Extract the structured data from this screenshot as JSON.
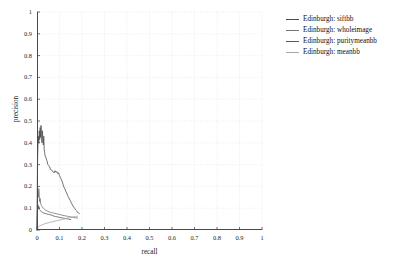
{
  "chart_data": {
    "type": "line",
    "title": "",
    "xlabel": "recall",
    "ylabel": "precision",
    "xlim": [
      0,
      1
    ],
    "ylim": [
      0,
      1
    ],
    "grid": true,
    "grid_style": "dotted",
    "legend_position": "right",
    "xticks": [
      "0",
      "0.1",
      "0.2",
      "0.3",
      "0.4",
      "0.5",
      "0.6",
      "0.7",
      "0.8",
      "0.9",
      "1"
    ],
    "xtick_values": [
      0,
      0.1,
      0.2,
      0.3,
      0.4,
      0.5,
      0.6,
      0.7,
      0.8,
      0.9,
      1
    ],
    "yticks": [
      "0",
      "0.1",
      "0.2",
      "0.3",
      "0.4",
      "0.5",
      "0.6",
      "0.7",
      "0.8",
      "0.9",
      "1"
    ],
    "ytick_values": [
      0,
      0.1,
      0.2,
      0.3,
      0.4,
      0.5,
      0.6,
      0.7,
      0.8,
      0.9,
      1
    ],
    "series": [
      {
        "name": "Edinburgh: siftbb",
        "color": "#4d4d4d",
        "points": [
          [
            0.0,
            0.0
          ],
          [
            0.002,
            0.3
          ],
          [
            0.004,
            0.38
          ],
          [
            0.006,
            0.43
          ],
          [
            0.008,
            0.4
          ],
          [
            0.01,
            0.455
          ],
          [
            0.012,
            0.415
          ],
          [
            0.014,
            0.47
          ],
          [
            0.016,
            0.425
          ],
          [
            0.018,
            0.48
          ],
          [
            0.02,
            0.44
          ],
          [
            0.022,
            0.4
          ],
          [
            0.024,
            0.455
          ],
          [
            0.026,
            0.42
          ],
          [
            0.028,
            0.39
          ],
          [
            0.03,
            0.43
          ],
          [
            0.032,
            0.37
          ],
          [
            0.034,
            0.355
          ],
          [
            0.036,
            0.34
          ],
          [
            0.04,
            0.33
          ],
          [
            0.044,
            0.318
          ],
          [
            0.048,
            0.3
          ],
          [
            0.052,
            0.296
          ],
          [
            0.056,
            0.29
          ],
          [
            0.06,
            0.278
          ],
          [
            0.064,
            0.276
          ],
          [
            0.068,
            0.27
          ],
          [
            0.072,
            0.268
          ],
          [
            0.076,
            0.262
          ],
          [
            0.08,
            0.272
          ],
          [
            0.084,
            0.265
          ],
          [
            0.088,
            0.268
          ],
          [
            0.092,
            0.258
          ],
          [
            0.096,
            0.262
          ],
          [
            0.1,
            0.25
          ],
          [
            0.104,
            0.24
          ],
          [
            0.108,
            0.232
          ],
          [
            0.112,
            0.222
          ],
          [
            0.116,
            0.208
          ],
          [
            0.12,
            0.196
          ],
          [
            0.124,
            0.188
          ],
          [
            0.128,
            0.178
          ],
          [
            0.132,
            0.17
          ],
          [
            0.136,
            0.158
          ],
          [
            0.14,
            0.15
          ],
          [
            0.144,
            0.142
          ],
          [
            0.148,
            0.134
          ],
          [
            0.152,
            0.126
          ],
          [
            0.156,
            0.118
          ],
          [
            0.16,
            0.11
          ],
          [
            0.164,
            0.104
          ],
          [
            0.168,
            0.098
          ],
          [
            0.172,
            0.092
          ],
          [
            0.176,
            0.088
          ],
          [
            0.18,
            0.082
          ],
          [
            0.184,
            0.078
          ],
          [
            0.188,
            0.076
          ]
        ]
      },
      {
        "name": "Edinburgh: wholeimage",
        "color": "#737373",
        "points": [
          [
            0.0,
            0.0
          ],
          [
            0.002,
            0.14
          ],
          [
            0.004,
            0.175
          ],
          [
            0.006,
            0.15
          ],
          [
            0.008,
            0.19
          ],
          [
            0.01,
            0.16
          ],
          [
            0.012,
            0.13
          ],
          [
            0.014,
            0.145
          ],
          [
            0.016,
            0.12
          ],
          [
            0.02,
            0.112
          ],
          [
            0.024,
            0.105
          ],
          [
            0.028,
            0.1
          ],
          [
            0.032,
            0.096
          ],
          [
            0.036,
            0.092
          ],
          [
            0.04,
            0.09
          ],
          [
            0.048,
            0.086
          ],
          [
            0.056,
            0.082
          ],
          [
            0.064,
            0.08
          ],
          [
            0.072,
            0.078
          ],
          [
            0.08,
            0.076
          ],
          [
            0.088,
            0.074
          ],
          [
            0.096,
            0.072
          ],
          [
            0.104,
            0.07
          ],
          [
            0.112,
            0.068
          ],
          [
            0.12,
            0.066
          ],
          [
            0.13,
            0.064
          ],
          [
            0.14,
            0.062
          ],
          [
            0.15,
            0.06
          ],
          [
            0.16,
            0.058
          ],
          [
            0.17,
            0.056
          ],
          [
            0.18,
            0.055
          ]
        ]
      },
      {
        "name": "Edinburgh: puritymeanbb",
        "color": "#595959",
        "points": [
          [
            0.0,
            0.0
          ],
          [
            0.002,
            0.09
          ],
          [
            0.004,
            0.115
          ],
          [
            0.006,
            0.098
          ],
          [
            0.008,
            0.108
          ],
          [
            0.01,
            0.095
          ],
          [
            0.014,
            0.09
          ],
          [
            0.018,
            0.086
          ],
          [
            0.022,
            0.082
          ],
          [
            0.026,
            0.08
          ],
          [
            0.03,
            0.078
          ],
          [
            0.036,
            0.076
          ],
          [
            0.042,
            0.074
          ],
          [
            0.05,
            0.072
          ],
          [
            0.058,
            0.07
          ],
          [
            0.066,
            0.068
          ],
          [
            0.074,
            0.064
          ],
          [
            0.082,
            0.062
          ],
          [
            0.09,
            0.06
          ],
          [
            0.1,
            0.058
          ],
          [
            0.11,
            0.056
          ],
          [
            0.12,
            0.054
          ],
          [
            0.13,
            0.052
          ],
          [
            0.14,
            0.05
          ],
          [
            0.15,
            0.048
          ]
        ]
      },
      {
        "name": "Edinburgh: meanbb",
        "color": "#a6a6a6",
        "points": [
          [
            0.0,
            0.0
          ],
          [
            0.004,
            0.012
          ],
          [
            0.01,
            0.018
          ],
          [
            0.018,
            0.022
          ],
          [
            0.028,
            0.026
          ],
          [
            0.04,
            0.03
          ],
          [
            0.054,
            0.034
          ],
          [
            0.07,
            0.038
          ],
          [
            0.086,
            0.042
          ],
          [
            0.102,
            0.046
          ],
          [
            0.118,
            0.05
          ],
          [
            0.134,
            0.054
          ],
          [
            0.15,
            0.058
          ],
          [
            0.162,
            0.06
          ],
          [
            0.172,
            0.062
          ],
          [
            0.18,
            0.063
          ]
        ]
      }
    ]
  },
  "legend": {
    "items": [
      {
        "label": "Edinburgh: siftbb",
        "color": "#4d4d4d"
      },
      {
        "label": "Edinburgh: wholeimage",
        "color": "#737373"
      },
      {
        "label": "Edinburgh: puritymeanbb",
        "color": "#595959"
      },
      {
        "label": "Edinburgh: meanbb",
        "color": "#a6a6a6"
      }
    ]
  },
  "style": {
    "axis_color": "#4a4a4a",
    "grid_color": "#d9d9d9",
    "background": "#ffffff",
    "text_color": "#1a1a1a"
  }
}
